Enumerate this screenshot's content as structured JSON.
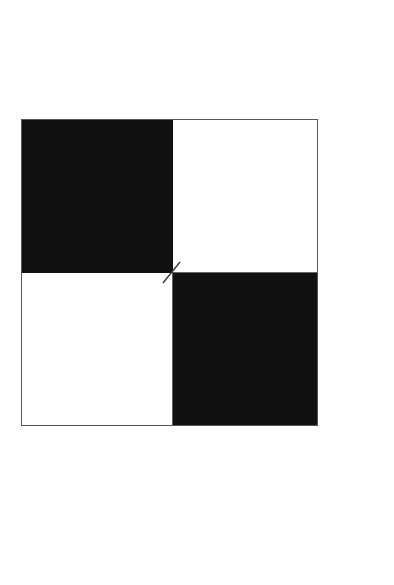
{
  "image": {
    "description": "Two-by-two checkerboard square: dark top-left and bottom-right cells, white top-right and bottom-left cells, with a short diagonal slash at the center junction",
    "background": "#ffffff"
  },
  "board": {
    "rows": 2,
    "cols": 2,
    "border_color": "#555555",
    "cells": [
      {
        "position": "top-left",
        "color": "#111111",
        "shade": "dark"
      },
      {
        "position": "top-right",
        "color": "#ffffff",
        "shade": "light"
      },
      {
        "position": "bottom-left",
        "color": "#ffffff",
        "shade": "light"
      },
      {
        "position": "bottom-right",
        "color": "#111111",
        "shade": "dark"
      }
    ]
  },
  "center_mark": {
    "shape": "diagonal-slash",
    "color": "#333333"
  }
}
